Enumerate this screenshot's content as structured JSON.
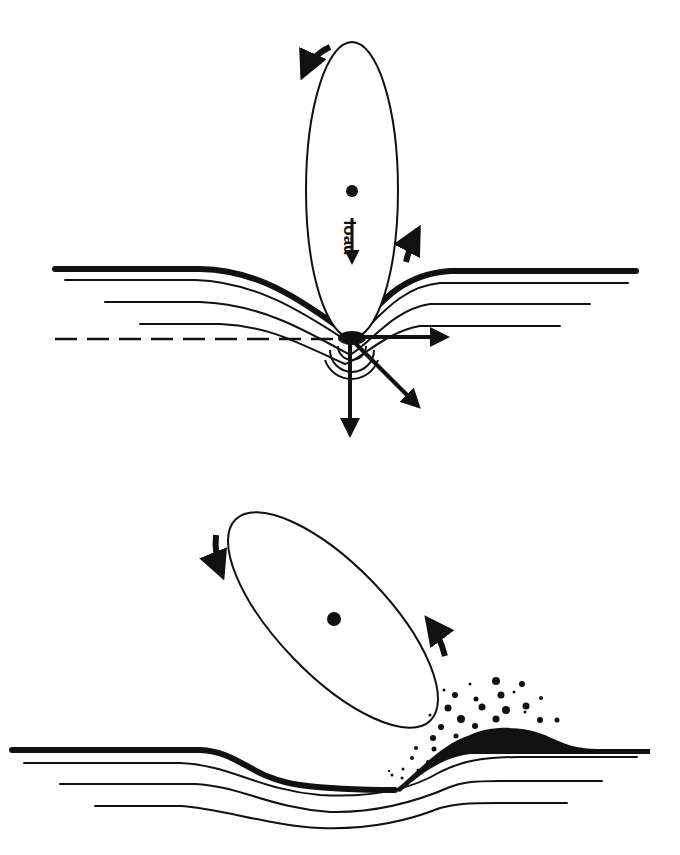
{
  "diagram": {
    "type": "schematic",
    "panels": [
      {
        "id": "top",
        "description": "Elongated particle indenting surface under load with stress arrows",
        "labels": {
          "load": "load"
        },
        "elements": [
          "particle-ellipse",
          "center-of-mass-dot",
          "load-arrow",
          "rotation-arrows",
          "deformed-surface-layers",
          "reference-dashed-line",
          "force-vector-arrows"
        ]
      },
      {
        "id": "bottom",
        "description": "Tilted particle ploughing surface, pushing material into a pile-up with debris",
        "elements": [
          "particle-ellipse",
          "center-of-mass-dot",
          "rotation-arrows",
          "grooved-surface-layers",
          "pile-up",
          "debris-particles"
        ]
      }
    ],
    "colors": {
      "ink": "#111111",
      "background": "#ffffff"
    }
  }
}
